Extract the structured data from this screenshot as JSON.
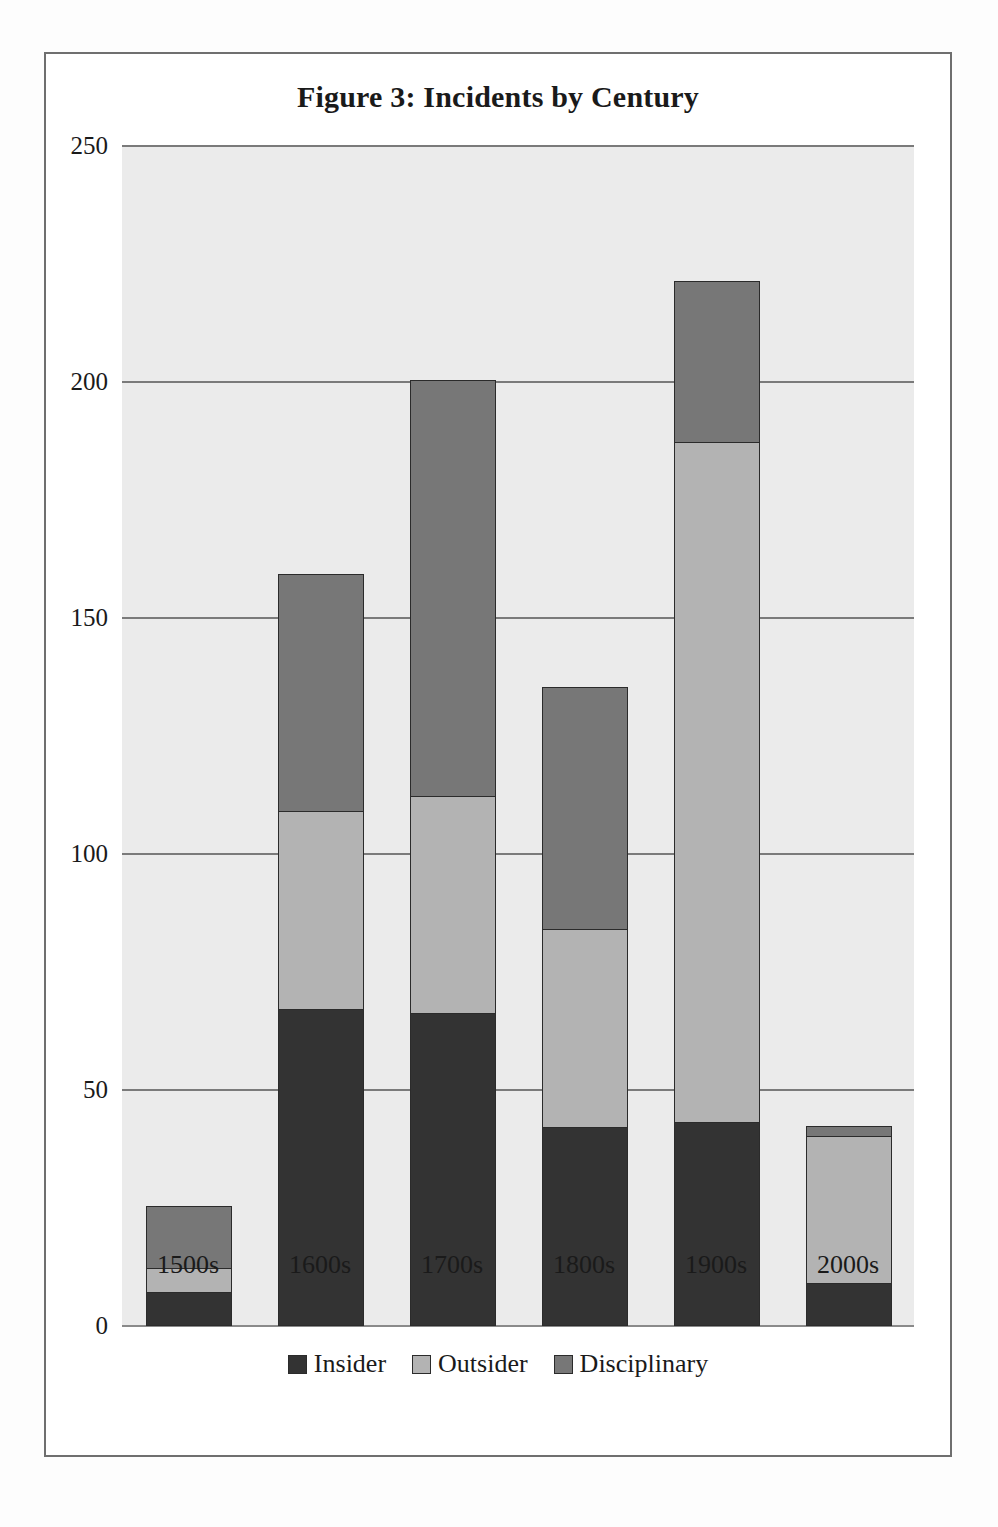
{
  "figure": {
    "title": "Figure 3: Incidents by Century"
  },
  "chart_data": {
    "type": "bar",
    "subtype": "stacked-vertical",
    "title": "Figure 3: Incidents by Century",
    "xlabel": "",
    "ylabel": "",
    "categories": [
      "1500s",
      "1600s",
      "1700s",
      "1800s",
      "1900s",
      "2000s"
    ],
    "series": [
      {
        "name": "Insider",
        "color": "#333333",
        "values": [
          7,
          67,
          66,
          42,
          43,
          9
        ]
      },
      {
        "name": "Outsider",
        "color": "#b3b3b3",
        "values": [
          5,
          42,
          46,
          42,
          144,
          31
        ]
      },
      {
        "name": "Disciplinary",
        "color": "#777777",
        "values": [
          13,
          50,
          88,
          51,
          34,
          2
        ]
      }
    ],
    "totals": [
      25,
      159,
      200,
      135,
      221,
      42
    ],
    "ylim": [
      0,
      250
    ],
    "yticks": [
      "0",
      "50",
      "100",
      "150",
      "200",
      "250"
    ],
    "ytick_values": [
      0,
      50,
      100,
      150,
      200,
      250
    ],
    "grid": true,
    "grid_axis": "y",
    "legend_position": "bottom",
    "plot_background": "#ebebeb",
    "stack_order_bottom_to_top": [
      "Insider",
      "Outsider",
      "Disciplinary"
    ]
  },
  "legend": {
    "items": [
      {
        "label": "Insider",
        "color": "#333333"
      },
      {
        "label": "Outsider",
        "color": "#b3b3b3"
      },
      {
        "label": "Disciplinary",
        "color": "#777777"
      }
    ]
  }
}
